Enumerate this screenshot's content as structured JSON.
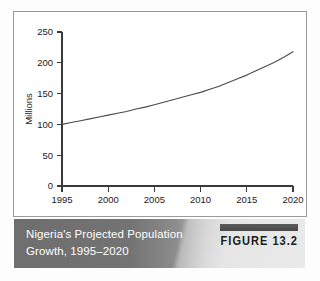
{
  "figure": {
    "badge_label": "FIGURE 13.2",
    "caption_line_1": "Nigeria's Projected Population",
    "caption_line_2": "Growth, 1995–2020",
    "caption_text_color": "#ffffff",
    "badge_text_color": "#1c1c1c",
    "panel_border_color": "#9a9a9a",
    "panel_background": "#ffffff"
  },
  "chart_data": {
    "type": "line",
    "title": "Nigeria's Projected Population Growth, 1995–2020",
    "xlabel": "",
    "ylabel": "Millions",
    "x": [
      1995,
      1996,
      1997,
      1998,
      1999,
      2000,
      2001,
      2002,
      2003,
      2004,
      2005,
      2006,
      2007,
      2008,
      2009,
      2010,
      2011,
      2012,
      2013,
      2014,
      2015,
      2016,
      2017,
      2018,
      2019,
      2020
    ],
    "values": [
      100,
      103,
      106,
      109,
      112,
      115,
      118,
      121,
      125,
      128,
      132,
      136,
      140,
      144,
      148,
      152,
      157,
      162,
      168,
      174,
      180,
      187,
      194,
      201,
      209,
      218
    ],
    "series": [
      {
        "name": "Projected population",
        "color": "#4a4a4a",
        "values": [
          100,
          103,
          106,
          109,
          112,
          115,
          118,
          121,
          125,
          128,
          132,
          136,
          140,
          144,
          148,
          152,
          157,
          162,
          168,
          174,
          180,
          187,
          194,
          201,
          209,
          218
        ]
      }
    ],
    "xticks": [
      1995,
      2000,
      2005,
      2010,
      2015,
      2020
    ],
    "xtick_labels": [
      "1995",
      "2000",
      "2005",
      "2010",
      "2015",
      "2020"
    ],
    "yticks": [
      0,
      50,
      100,
      150,
      200,
      250
    ],
    "ytick_labels": [
      "0",
      "50",
      "100",
      "150",
      "200",
      "250"
    ],
    "xlim": [
      1995,
      2020
    ],
    "ylim": [
      0,
      250
    ],
    "grid": false,
    "legend": false
  }
}
